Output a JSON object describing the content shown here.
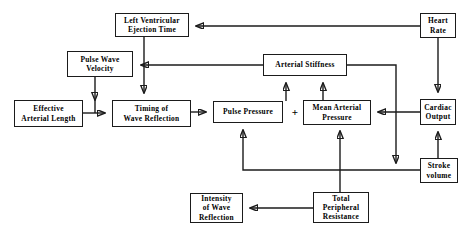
{
  "diagram": {
    "type": "flowchart",
    "canvas": {
      "width": 472,
      "height": 236
    },
    "line_color": "#1b1b1b",
    "background_color": "#ffffff",
    "operator_symbol": "+",
    "nodes": [
      {
        "id": "lvet",
        "label": "Left  Ventricular\nEjection  Time",
        "x": 115,
        "y": 13,
        "w": 74,
        "h": 24,
        "font_size": 7.4
      },
      {
        "id": "heart",
        "label": "Heart\nRate",
        "x": 420,
        "y": 13,
        "w": 36,
        "h": 25,
        "font_size": 7.4
      },
      {
        "id": "pwv",
        "label": "Pulse  Wave\nVelocity",
        "x": 67,
        "y": 51,
        "w": 66,
        "h": 26,
        "font_size": 7.4
      },
      {
        "id": "stiff",
        "label": "Arterial   Stiffness",
        "x": 263,
        "y": 54,
        "w": 84,
        "h": 22,
        "font_size": 7.4
      },
      {
        "id": "eal",
        "label": "Effective\nArterial  Length",
        "x": 14,
        "y": 100,
        "w": 69,
        "h": 27,
        "font_size": 7.4
      },
      {
        "id": "timing",
        "label": "Timing  of\nWave   Reflection",
        "x": 112,
        "y": 100,
        "w": 79,
        "h": 27,
        "font_size": 7.4
      },
      {
        "id": "pp",
        "label": "Pulse   Pressure",
        "x": 213,
        "y": 101,
        "w": 70,
        "h": 22,
        "font_size": 7.4
      },
      {
        "id": "map",
        "label": "Mean  Arterial\nPressure",
        "x": 303,
        "y": 100,
        "w": 68,
        "h": 25,
        "font_size": 7.4
      },
      {
        "id": "co",
        "label": "Cardiac\nOutput",
        "x": 420,
        "y": 99,
        "w": 36,
        "h": 26,
        "font_size": 7.4
      },
      {
        "id": "sv",
        "label": "Stroke\nvolume",
        "x": 420,
        "y": 158,
        "w": 38,
        "h": 25,
        "font_size": 7.4
      },
      {
        "id": "iwr",
        "label": "Intensity\nof Wave\nReflection",
        "x": 190,
        "y": 193,
        "w": 53,
        "h": 30,
        "font_size": 7.4
      },
      {
        "id": "tpr",
        "label": "Total\nPeripheral\nResistance",
        "x": 313,
        "y": 192,
        "w": 56,
        "h": 31,
        "font_size": 7.4
      }
    ],
    "edges": [
      {
        "from": "heart",
        "to": "lvet",
        "description": "Heart Rate to Left Ventricular Ejection Time"
      },
      {
        "from": "lvet",
        "to": "timing",
        "description": "Left Ventricular Ejection Time to Timing of Wave Reflection"
      },
      {
        "from": "stiff",
        "to": "pwv",
        "description": "Arterial Stiffness to Pulse Wave Velocity"
      },
      {
        "from": "pwv",
        "to": "timing",
        "description": "Pulse Wave Velocity to Timing of Wave Reflection"
      },
      {
        "from": "eal",
        "to": "timing",
        "description": "Effective Arterial Length to Timing of Wave Reflection"
      },
      {
        "from": "timing",
        "to": "pp",
        "description": "Timing of Wave Reflection to Pulse Pressure"
      },
      {
        "from": "pp",
        "to": "stiff",
        "description": "Pulse Pressure to Arterial Stiffness"
      },
      {
        "from": "map",
        "to": "stiff",
        "description": "Mean Arterial Pressure to Arterial Stiffness"
      },
      {
        "from": "co",
        "to": "map",
        "description": "Cardiac Output to Mean Arterial Pressure"
      },
      {
        "from": "heart",
        "to": "co",
        "description": "Heart Rate to Cardiac Output"
      },
      {
        "from": "sv",
        "to": "co",
        "description": "Stroke volume to Cardiac Output"
      },
      {
        "from": "sv",
        "to": "pp",
        "description": "Stroke volume to Pulse Pressure"
      },
      {
        "from": "stiff",
        "to": "sv",
        "description": "Arterial Stiffness down to Stroke volume line"
      },
      {
        "from": "tpr",
        "to": "map",
        "description": "Total Peripheral Resistance to Mean Arterial Pressure"
      },
      {
        "from": "tpr",
        "to": "iwr",
        "description": "Total Peripheral Resistance to Intensity of Wave Reflection"
      }
    ]
  }
}
